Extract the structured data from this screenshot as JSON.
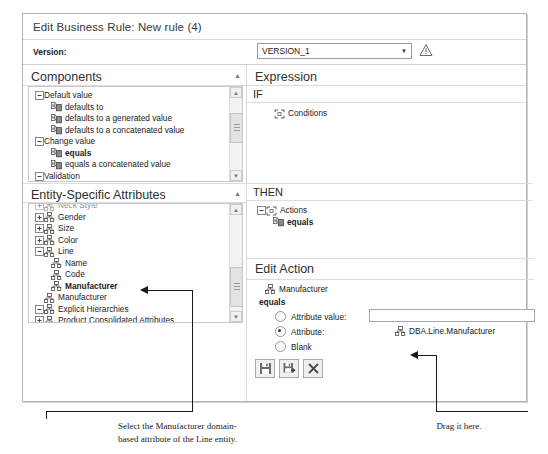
{
  "window": {
    "title": "Edit Business Rule: New rule (4)"
  },
  "version_bar": {
    "label": "Version:",
    "selected": "VERSION_1",
    "dropdown_icon": "chevron-down-icon",
    "warning_icon": "warning-triangle-icon"
  },
  "components_panel": {
    "title": "Components",
    "collapse_icon": "caret-up-icon",
    "tree": [
      {
        "label": "Default value",
        "indent": 0,
        "expander": "minus",
        "icon": "",
        "bold": false
      },
      {
        "label": "defaults to",
        "indent": 1,
        "expander": "",
        "icon": "component-icon",
        "bold": false
      },
      {
        "label": "defaults to a generated value",
        "indent": 1,
        "expander": "",
        "icon": "component-icon",
        "bold": false
      },
      {
        "label": "defaults to a concatenated value",
        "indent": 1,
        "expander": "",
        "icon": "component-icon",
        "bold": false
      },
      {
        "label": "Change value",
        "indent": 0,
        "expander": "minus",
        "icon": "",
        "bold": false
      },
      {
        "label": "equals",
        "indent": 1,
        "expander": "",
        "icon": "component-icon",
        "bold": true
      },
      {
        "label": "equals a concatenated value",
        "indent": 1,
        "expander": "",
        "icon": "component-icon",
        "bold": false
      },
      {
        "label": "Validation",
        "indent": 0,
        "expander": "minus",
        "icon": "",
        "bold": false
      },
      {
        "label": "is required",
        "indent": 1,
        "expander": "",
        "icon": "component-icon",
        "bold": false
      }
    ],
    "scrollbar": {
      "up_icon": "arrow-up-icon",
      "down_icon": "arrow-down-icon"
    }
  },
  "attributes_panel": {
    "title": "Entity-Specific Attributes",
    "collapse_icon": "caret-up-icon",
    "tree": [
      {
        "label": "Neck Style",
        "indent": 0,
        "expander": "plus",
        "icon": "attribute-icon",
        "bold": false,
        "clipped": true
      },
      {
        "label": "Gender",
        "indent": 0,
        "expander": "plus",
        "icon": "attribute-icon",
        "bold": false
      },
      {
        "label": "Size",
        "indent": 0,
        "expander": "plus",
        "icon": "attribute-icon",
        "bold": false
      },
      {
        "label": "Color",
        "indent": 0,
        "expander": "plus",
        "icon": "attribute-icon",
        "bold": false
      },
      {
        "label": "Line",
        "indent": 0,
        "expander": "minus",
        "icon": "attribute-icon",
        "bold": false
      },
      {
        "label": "Name",
        "indent": 1,
        "expander": "",
        "icon": "attribute-icon",
        "bold": false
      },
      {
        "label": "Code",
        "indent": 1,
        "expander": "",
        "icon": "attribute-icon",
        "bold": false
      },
      {
        "label": "Manufacturer",
        "indent": 1,
        "expander": "",
        "icon": "attribute-icon",
        "bold": true
      },
      {
        "label": "Manufacturer",
        "indent": 0,
        "expander": "",
        "icon": "attribute-icon",
        "bold": false
      },
      {
        "label": "Explicit Hierarchies",
        "indent": 0,
        "expander": "minus",
        "icon": "attribute-icon",
        "bold": false
      },
      {
        "label": "Product Consolidated Attributes",
        "indent": 0,
        "expander": "plus",
        "icon": "attribute-icon",
        "bold": false
      }
    ],
    "scrollbar": {
      "up_icon": "arrow-up-icon",
      "down_icon": "arrow-down-icon"
    }
  },
  "expression_panel": {
    "title": "Expression",
    "if_label": "IF",
    "if_nodes": [
      {
        "label": "Conditions",
        "icon": "conditions-icon",
        "expander": ""
      }
    ],
    "then_label": "THEN",
    "then_nodes": [
      {
        "label": "Actions",
        "icon": "actions-icon",
        "expander": "minus",
        "bold": false
      },
      {
        "label": "equals",
        "icon": "component-icon",
        "expander": "",
        "bold": true
      }
    ]
  },
  "edit_action": {
    "title": "Edit Action",
    "attribute_name": "Manufacturer",
    "attribute_icon": "attribute-icon",
    "operator": "equals",
    "options": [
      {
        "label": "Attribute value:",
        "selected": false,
        "name": "attribute-value"
      },
      {
        "label": "Attribute:",
        "selected": true,
        "name": "attribute"
      },
      {
        "label": "Blank",
        "selected": false,
        "name": "blank"
      }
    ],
    "attribute_value_input": "",
    "attribute_target": "DBA.Line.Manufacturer",
    "attribute_target_icon": "attribute-icon",
    "buttons": [
      {
        "name": "save-button",
        "icon": "save-icon"
      },
      {
        "name": "save-and-new-button",
        "icon": "save-plus-icon"
      },
      {
        "name": "cancel-button",
        "icon": "close-x-icon"
      }
    ]
  },
  "annotations": [
    {
      "name": "annotation-select-manufacturer",
      "line1": "Select the Manufacturer domain-",
      "line2": "based attribute of the Line entity."
    },
    {
      "name": "annotation-drag-it-here",
      "line1": "Drag it here.",
      "line2": ""
    }
  ]
}
